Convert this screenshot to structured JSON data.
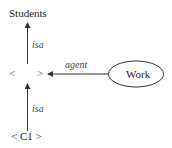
{
  "diagram": {
    "type": "semantic-network",
    "nodes": {
      "students": {
        "label": "Students"
      },
      "anon_left": "<",
      "anon_right": ">",
      "work": {
        "label": "Work",
        "shape": "ellipse"
      },
      "c1": {
        "label": "< C1 >"
      }
    },
    "edges": {
      "top_isa": {
        "label": "isa",
        "from": "anonymous",
        "to": "Students"
      },
      "agent": {
        "label": "agent",
        "from": "Work",
        "to": "anonymous"
      },
      "bottom_isa": {
        "label": "isa",
        "from": "< C1 >",
        "to": "anonymous"
      }
    },
    "colors": {
      "line": "#333333",
      "text": "#222222",
      "background": "#ffffff"
    }
  }
}
